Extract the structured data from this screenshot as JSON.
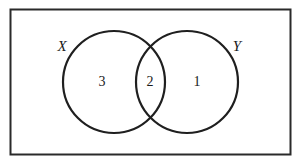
{
  "diagram": {
    "type": "venn",
    "colors": {
      "stroke": "#222222",
      "background": "#ffffff",
      "text": "#1a1a1a"
    },
    "universe": {
      "x": 10,
      "y": 9,
      "width": 280,
      "height": 145
    },
    "sets": [
      {
        "name": "X",
        "cx": 114,
        "cy": 82,
        "r": 51,
        "label_x": 62,
        "label_y": 46
      },
      {
        "name": "Y",
        "cx": 187,
        "cy": 82,
        "r": 51,
        "label_x": 237,
        "label_y": 46
      }
    ],
    "regions": [
      {
        "id": "only-x",
        "value": "3",
        "x": 102,
        "y": 82
      },
      {
        "id": "x-and-y",
        "value": "2",
        "x": 150,
        "y": 82
      },
      {
        "id": "only-y",
        "value": "1",
        "x": 197,
        "y": 82
      }
    ]
  }
}
